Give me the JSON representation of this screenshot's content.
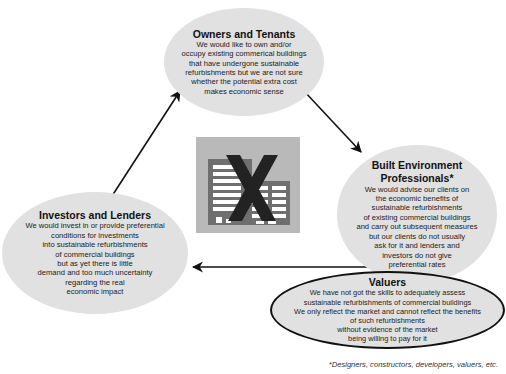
{
  "nodes": {
    "owners": {
      "title": "Owners and Tenants",
      "body": "We would like to own and/or\noccupy existing commerical buildings\nthat have undergone sustainable\nrefurbishments but we are not sure\nwhether the potential extra cost\nmakes economic sense"
    },
    "built": {
      "title": "Built Environment\nProfessionals*",
      "body": "We would advise our clients on\nthe economic benefits of\nsustainable refurbishments\nof existing commercial buildings\nand carry out subsequent measures\nbut our clients do not usually\nask for it and lenders and\ninvestors do not give\npreferential rates"
    },
    "valuers": {
      "title": "Valuers",
      "body": "We have not got the skills to adequately assess\nsustainable refurbishments of commercial buildings\nWe only reflect the market and cannot reflect the benefits\nof such refurbishments\nwithout evidence of the market\nbeing willing to pay for it"
    },
    "investors": {
      "title": "Investors and Lenders",
      "body": "We would invest in or provide preferential\nconditions for investments\ninto sustainable refurbishments\nof commercial buildings\nbut as yet there is little\ndemand and too much uncertainty\nregarding the real\neconomic impact"
    }
  },
  "center_icon": "crossed-out-buildings-icon",
  "arrows": [
    {
      "from": "owners",
      "to": "built"
    },
    {
      "from": "valuers",
      "to": "investors"
    },
    {
      "from": "investors",
      "to": "owners"
    }
  ],
  "footnote": "*Designers, constructors, developers, valuers, etc.",
  "colors": {
    "ellipse_fill": "#e1e1e1",
    "icon_background": "#b9b9b9",
    "building_dark": "#6f6f6f",
    "cross": "#222222"
  }
}
